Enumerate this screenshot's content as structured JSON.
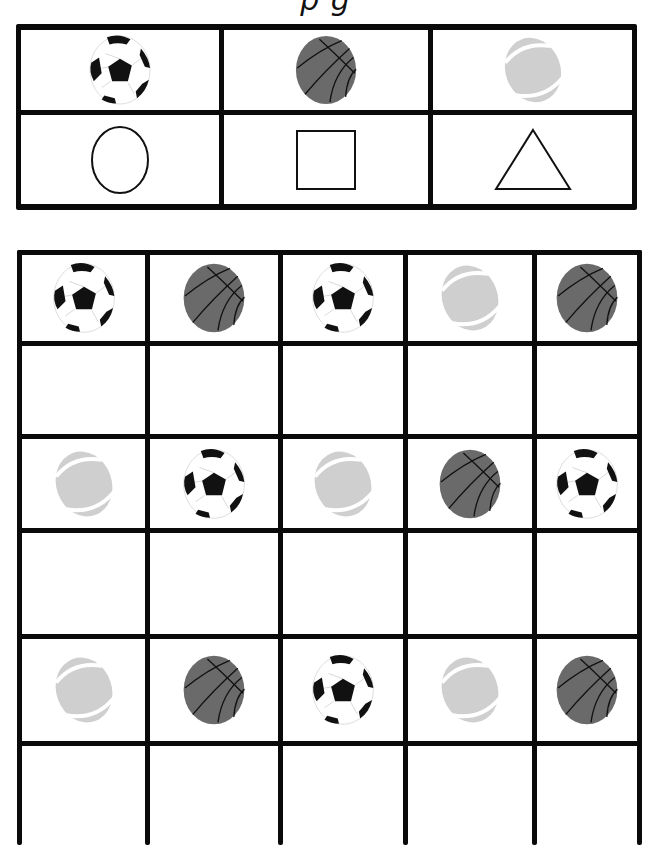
{
  "worksheet": {
    "title_visible_fragment": "p                                      g",
    "key_table": {
      "balls": [
        "soccer",
        "basketball",
        "rugby"
      ],
      "shapes": [
        "circle",
        "square",
        "triangle"
      ]
    },
    "grid": {
      "columns": 5,
      "rows": [
        {
          "type": "balls",
          "items": [
            "soccer",
            "basketball",
            "soccer",
            "rugby",
            "basketball"
          ]
        },
        {
          "type": "answer",
          "items": [
            "",
            "",
            "",
            "",
            ""
          ]
        },
        {
          "type": "balls",
          "items": [
            "rugby",
            "soccer",
            "rugby",
            "basketball",
            "soccer"
          ]
        },
        {
          "type": "answer",
          "items": [
            "",
            "",
            "",
            "",
            ""
          ]
        },
        {
          "type": "balls",
          "items": [
            "rugby",
            "basketball",
            "soccer",
            "rugby",
            "basketball"
          ]
        },
        {
          "type": "answer",
          "items": [
            "",
            "",
            "",
            "",
            ""
          ]
        }
      ]
    },
    "colors": {
      "line": "#0a0a0a",
      "basketball": "#6a6a6a",
      "rugby": "#cfcfcf",
      "soccer_patch": "#111111"
    }
  }
}
